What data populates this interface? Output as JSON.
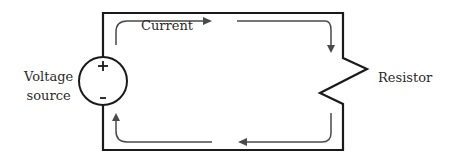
{
  "diagram": {
    "type": "simple-circuit",
    "labels": {
      "current": "Current",
      "voltage_source_line1": "Voltage",
      "voltage_source_line2": "source",
      "resistor": "Resistor"
    },
    "source_terminals": {
      "positive": "+",
      "negative": "-"
    },
    "colors": {
      "wire": "#1a1a1a",
      "arrow": "#4a4a4a",
      "text": "#2a2a2a",
      "background": "#ffffff"
    }
  }
}
